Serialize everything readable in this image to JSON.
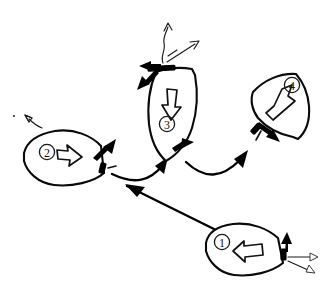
{
  "figure": {
    "kind": "hand-drawn-diagram",
    "background_color": "#ffffff",
    "ink_color": "#000000",
    "width": 329,
    "height": 291
  },
  "stages": [
    {
      "id": "stage-1",
      "label": "1",
      "heading": "bow up-left",
      "body_arrow": "hollow arrow pointing left",
      "stern_marks": [
        "solid black arrow pointing up",
        "thin outline arrow pointing right",
        "thin outline arrow pointing down-right"
      ]
    },
    {
      "id": "stage-2",
      "label": "2",
      "heading": "bow left, stern right",
      "body_arrow": "hollow arrow pointing right",
      "stern_marks": [
        "solid black arrow pointing up-right",
        "short dash"
      ],
      "bow_marks": [
        "thin arrow pointing up-left"
      ]
    },
    {
      "id": "stage-3",
      "label": "3",
      "heading": "bow down",
      "body_arrow": "hollow arrow pointing down",
      "stern_marks": [
        "solid black arrow pointing left",
        "solid black arrow pointing down-left",
        "thin wavy arrow pointing up",
        "thin arrow pointing up-right"
      ],
      "bow_marks": [
        "solid black arrow pointing right"
      ]
    },
    {
      "id": "stage-4",
      "label": "4",
      "heading": "bow up-right",
      "body_arrow": "hollow arrow pointing up-right",
      "stern_marks": [
        "solid black arrow pointing down-right",
        "short dash"
      ]
    }
  ],
  "trajectory": {
    "name": "maneuver-path",
    "segments": [
      {
        "from": "1",
        "to": "2",
        "style": "straight arrow pointing up-left"
      },
      {
        "from": "2",
        "to": "3",
        "style": "curved arc arrow pointing up-right"
      },
      {
        "from": "3",
        "to": "4",
        "style": "curved arc arrow pointing up-right"
      }
    ]
  },
  "marks": {
    "stray_dot": "small ink dot at far left"
  }
}
